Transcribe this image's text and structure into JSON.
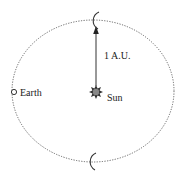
{
  "diagram": {
    "labels": {
      "earth": "Earth",
      "sun": "Sun",
      "distance": "1 A.U."
    },
    "icons": {
      "sun": "sun-icon",
      "earth": "earth-icon",
      "crescent_moon": "crescent-moon-icon",
      "arrow": "arrow-up-icon"
    },
    "colors": {
      "orbit": "#555555",
      "sun_fill": "#888888",
      "line": "#333333"
    }
  }
}
